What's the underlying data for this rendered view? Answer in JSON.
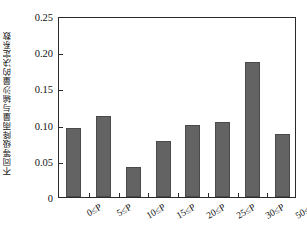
{
  "chart_data": {
    "type": "bar",
    "title": "",
    "xlabel": "",
    "ylabel": "不同等级降雨量与输沙量的决定系数",
    "categories": [
      "0≤P",
      "5≤P",
      "10≤P",
      "15≤P",
      "20≤P",
      "25≤P",
      "30≤P",
      "50≤P"
    ],
    "values": [
      0.095,
      0.112,
      0.041,
      0.078,
      0.1,
      0.103,
      0.187,
      0.087
    ],
    "series": [
      {
        "name": "决定系数",
        "values": [
          0.095,
          0.112,
          0.041,
          0.078,
          0.1,
          0.103,
          0.187,
          0.087
        ]
      }
    ],
    "ylim": [
      0,
      0.25
    ],
    "ytick_labels": [
      "0",
      "0.05",
      "0.10",
      "0.15",
      "0.20",
      "0.25"
    ],
    "ytick_values": [
      0,
      0.05,
      0.1,
      0.15,
      0.2,
      0.25
    ],
    "grid": false,
    "legend": false,
    "legend_position": "none",
    "bar_color": "#636363",
    "bar_edge_color": "#4a4a4a",
    "axis_color": "#2a2a2a",
    "background_color": "#ffffff",
    "xtick_label_rotation": -30
  }
}
